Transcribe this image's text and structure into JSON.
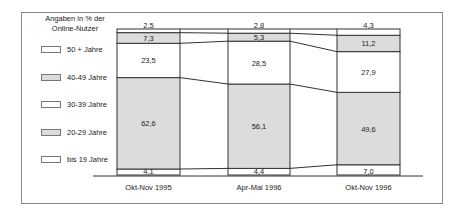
{
  "chart_data": {
    "type": "bar",
    "subtype": "stacked-100-percent",
    "title": "",
    "legend_title": "Angaben in % der Online-Nutzer",
    "categories": [
      "Okt-Nov 1995",
      "Apr-Mai 1996",
      "Okt-Nov 1996"
    ],
    "series": [
      {
        "name": "bis 19 Jahre",
        "values": [
          4.1,
          4.4,
          7.0
        ],
        "labels": [
          "4,1",
          "4,4",
          "7,0"
        ],
        "color": "#ffffff"
      },
      {
        "name": "20-29 Jahre",
        "values": [
          62.6,
          56.1,
          49.6
        ],
        "labels": [
          "62,6",
          "56,1",
          "49,6"
        ],
        "color": "#dcdcdc"
      },
      {
        "name": "30-39 Jahre",
        "values": [
          23.5,
          28.5,
          27.9
        ],
        "labels": [
          "23,5",
          "28,5",
          "27,9"
        ],
        "color": "#ffffff"
      },
      {
        "name": "40-49 Jahre",
        "values": [
          7.3,
          5.3,
          11.2
        ],
        "labels": [
          "7,3",
          "5,3",
          "11,2"
        ],
        "color": "#dcdcdc"
      },
      {
        "name": "50 + Jahre",
        "values": [
          2.5,
          2.8,
          4.3
        ],
        "labels": [
          "2,5",
          "2,8",
          "4,3"
        ],
        "color": "#ffffff"
      }
    ],
    "xlabel": "",
    "ylabel": "",
    "ylim": [
      0,
      100
    ],
    "grid": false,
    "legend_position": "left",
    "connector_lines": true
  },
  "legend": {
    "title_line1": "Angaben in % der",
    "title_line2": "Online-Nutzer",
    "items": [
      {
        "label": "50 + Jahre",
        "color": "#ffffff"
      },
      {
        "label": "40-49 Jahre",
        "color": "#dcdcdc"
      },
      {
        "label": "30-39 Jahre",
        "color": "#ffffff"
      },
      {
        "label": "20-29 Jahre",
        "color": "#dcdcdc"
      },
      {
        "label": "bis 19 Jahre",
        "color": "#ffffff"
      }
    ]
  }
}
